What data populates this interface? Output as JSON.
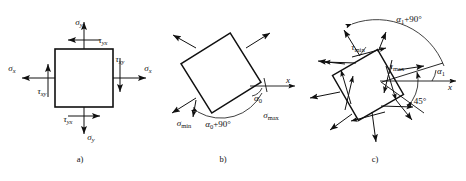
{
  "figure": {
    "background": "#ffffff",
    "ink_color": "#101010"
  },
  "panels": [
    {
      "id": "a",
      "caption": "a)",
      "caption_pos": {
        "x": 80,
        "y": 162
      },
      "description": "Square stress element with normal stresses sigma-x, sigma-y and shear stresses tau-xy, tau-yx",
      "element": {
        "type": "square",
        "x": 55,
        "y": 49,
        "w": 58,
        "h": 58,
        "rotation_deg": 0
      },
      "labels": [
        {
          "name": "sigma-y-top",
          "base": "σ",
          "sub": "y",
          "x": 79,
          "y": 25,
          "anchor": "middle"
        },
        {
          "name": "tau-yx-top",
          "base": "τ",
          "sub": "yx",
          "x": 103,
          "y": 43,
          "anchor": "middle"
        },
        {
          "name": "sigma-x-left",
          "base": "σ",
          "sub": "x",
          "x": 12,
          "y": 71,
          "anchor": "middle"
        },
        {
          "name": "tau-xy-left",
          "base": "τ",
          "sub": "xy",
          "x": 42,
          "y": 94,
          "anchor": "middle"
        },
        {
          "name": "tau-xy-right",
          "base": "τ",
          "sub": "xy",
          "x": 120,
          "y": 62,
          "anchor": "middle"
        },
        {
          "name": "sigma-x-right",
          "base": "σ",
          "sub": "x",
          "x": 148,
          "y": 71,
          "anchor": "middle"
        },
        {
          "name": "tau-yx-bottom",
          "base": "τ",
          "sub": "yx",
          "x": 68,
          "y": 122,
          "anchor": "middle"
        },
        {
          "name": "sigma-y-bottom",
          "base": "σ",
          "sub": "y",
          "x": 91,
          "y": 140,
          "anchor": "middle"
        }
      ]
    },
    {
      "id": "b",
      "caption": "b)",
      "caption_pos": {
        "x": 223,
        "y": 162
      },
      "description": "Principal stress element rotated by alpha-zero, carrying sigma-max and sigma-min",
      "element": {
        "type": "square",
        "cx": 221,
        "cy": 73,
        "size": 58,
        "rotation_deg": -32
      },
      "axis": {
        "name": "x-axis",
        "label": "x",
        "x1": 250,
        "y1": 86,
        "x2": 297,
        "y2": 86
      },
      "labels": [
        {
          "name": "sigma-min",
          "base": "σ",
          "sub": "min",
          "sub_style": "roman",
          "x": 184,
          "y": 126,
          "anchor": "middle"
        },
        {
          "name": "sigma-max",
          "base": "σ",
          "sub": "max",
          "sub_style": "roman",
          "x": 271,
          "y": 118,
          "anchor": "middle"
        },
        {
          "name": "x-axis-label",
          "base": "x",
          "sub": "",
          "x": 288,
          "y": 83,
          "anchor": "middle"
        }
      ],
      "angles": [
        {
          "name": "alpha-0",
          "text": "α",
          "sub": "0",
          "suffix": "",
          "x": 258,
          "y": 101
        },
        {
          "name": "alpha-0-plus-90",
          "text": "α",
          "sub": "0",
          "suffix": "+90°",
          "x": 218,
          "y": 127
        }
      ]
    },
    {
      "id": "c",
      "caption": "c)",
      "caption_pos": {
        "x": 375,
        "y": 162
      },
      "description": "Maximum shear stress element rotated 45 degrees from the principal directions, showing tau-max and tau-min",
      "element": {
        "type": "square",
        "cx": 368,
        "cy": 85,
        "size": 52,
        "rotation_deg": -30
      },
      "axis": {
        "name": "x-axis",
        "label": "x",
        "x1": 380,
        "y1": 81,
        "x2": 458,
        "y2": 81
      },
      "labels": [
        {
          "name": "tau-min",
          "base": "τ",
          "sub": "min",
          "sub_style": "roman",
          "x": 358,
          "y": 50,
          "anchor": "middle"
        },
        {
          "name": "tau-max",
          "base": "τ",
          "sub": "max",
          "sub_style": "roman",
          "x": 397,
          "y": 69,
          "anchor": "middle"
        },
        {
          "name": "x-axis-label",
          "base": "x",
          "sub": "",
          "x": 450,
          "y": 90,
          "anchor": "middle"
        }
      ],
      "angles": [
        {
          "name": "alpha-1",
          "text": "α",
          "sub": "1",
          "suffix": "",
          "x": 441,
          "y": 74
        },
        {
          "name": "alpha-1-plus-90",
          "text": "α",
          "sub": "1",
          "suffix": "+90°",
          "x": 409,
          "y": 22
        },
        {
          "name": "angle-45",
          "text": "45°",
          "sub": "",
          "suffix": "",
          "x": 420,
          "y": 104
        }
      ]
    }
  ]
}
